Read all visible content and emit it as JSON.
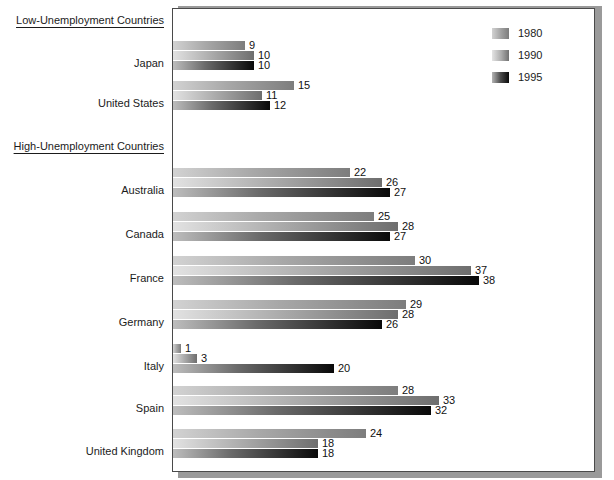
{
  "figure": {
    "background_color": "#ffffff",
    "frame_border_color": "#4a4a4a",
    "shadow_color": "#9a9a9a"
  },
  "groups": [
    {
      "heading": "Low-Unemployment Countries"
    },
    {
      "heading": "High-Unemployment Countries"
    }
  ],
  "legend": {
    "position": "top-right",
    "entries": [
      {
        "label": "1980",
        "swatch": "gradient-light-gray"
      },
      {
        "label": "1990",
        "swatch": "gradient-mid-gray"
      },
      {
        "label": "1995",
        "swatch": "gradient-black"
      }
    ]
  },
  "chart_data": {
    "type": "bar",
    "orientation": "horizontal",
    "title": "",
    "subtitle": "",
    "xlabel": "",
    "ylabel": "",
    "xlim": [
      0,
      38
    ],
    "grid": false,
    "legend_position": "top-right",
    "group_labels": [
      "Low-Unemployment Countries",
      "High-Unemployment Countries"
    ],
    "categories": [
      "Japan",
      "United States",
      "Australia",
      "Canada",
      "France",
      "Germany",
      "Italy",
      "Spain",
      "United Kingdom"
    ],
    "category_groups": [
      "Low-Unemployment Countries",
      "Low-Unemployment Countries",
      "High-Unemployment Countries",
      "High-Unemployment Countries",
      "High-Unemployment Countries",
      "High-Unemployment Countries",
      "High-Unemployment Countries",
      "High-Unemployment Countries",
      "High-Unemployment Countries"
    ],
    "series": [
      {
        "name": "1980",
        "values": [
          9,
          15,
          22,
          25,
          30,
          29,
          1,
          28,
          24
        ]
      },
      {
        "name": "1990",
        "values": [
          10,
          11,
          26,
          28,
          37,
          28,
          3,
          33,
          18
        ]
      },
      {
        "name": "1995",
        "values": [
          10,
          12,
          27,
          27,
          38,
          26,
          20,
          32,
          18
        ]
      }
    ]
  },
  "rows": [
    {
      "label": "Japan",
      "group": "low",
      "bars": [
        {
          "series": "1980",
          "value": 9,
          "value_text": "9"
        },
        {
          "series": "1990",
          "value": 10,
          "value_text": "10"
        },
        {
          "series": "1995",
          "value": 10,
          "value_text": "10"
        }
      ]
    },
    {
      "label": "United States",
      "group": "low",
      "bars": [
        {
          "series": "1980",
          "value": 15,
          "value_text": "15"
        },
        {
          "series": "1990",
          "value": 11,
          "value_text": "11"
        },
        {
          "series": "1995",
          "value": 12,
          "value_text": "12"
        }
      ]
    },
    {
      "label": "Australia",
      "group": "high",
      "bars": [
        {
          "series": "1980",
          "value": 22,
          "value_text": "22"
        },
        {
          "series": "1990",
          "value": 26,
          "value_text": "26"
        },
        {
          "series": "1995",
          "value": 27,
          "value_text": "27"
        }
      ]
    },
    {
      "label": "Canada",
      "group": "high",
      "bars": [
        {
          "series": "1980",
          "value": 25,
          "value_text": "25"
        },
        {
          "series": "1990",
          "value": 28,
          "value_text": "28"
        },
        {
          "series": "1995",
          "value": 27,
          "value_text": "27"
        }
      ]
    },
    {
      "label": "France",
      "group": "high",
      "bars": [
        {
          "series": "1980",
          "value": 30,
          "value_text": "30"
        },
        {
          "series": "1990",
          "value": 37,
          "value_text": "37"
        },
        {
          "series": "1995",
          "value": 38,
          "value_text": "38"
        }
      ]
    },
    {
      "label": "Germany",
      "group": "high",
      "bars": [
        {
          "series": "1980",
          "value": 29,
          "value_text": "29"
        },
        {
          "series": "1990",
          "value": 28,
          "value_text": "28"
        },
        {
          "series": "1995",
          "value": 26,
          "value_text": "26"
        }
      ]
    },
    {
      "label": "Italy",
      "group": "high",
      "bars": [
        {
          "series": "1980",
          "value": 1,
          "value_text": "1"
        },
        {
          "series": "1990",
          "value": 3,
          "value_text": "3"
        },
        {
          "series": "1995",
          "value": 20,
          "value_text": "20"
        }
      ]
    },
    {
      "label": "Spain",
      "group": "high",
      "bars": [
        {
          "series": "1980",
          "value": 28,
          "value_text": "28"
        },
        {
          "series": "1990",
          "value": 33,
          "value_text": "33"
        },
        {
          "series": "1995",
          "value": 32,
          "value_text": "32"
        }
      ]
    },
    {
      "label": "United Kingdom",
      "group": "high",
      "bars": [
        {
          "series": "1980",
          "value": 24,
          "value_text": "24"
        },
        {
          "series": "1990",
          "value": 18,
          "value_text": "18"
        },
        {
          "series": "1995",
          "value": 18,
          "value_text": "18"
        }
      ]
    }
  ],
  "layout": {
    "plot_left_px": 172,
    "plot_top_px": 8,
    "plot_width_px": 423,
    "plot_height_px": 464,
    "px_per_unit": 8.05,
    "bar_height_px": 9,
    "group_top_offsets": {
      "Japan": 40,
      "United States": 80,
      "Australia": 167,
      "Canada": 211,
      "France": 255,
      "Germany": 299,
      "Italy": 343,
      "Spain": 385,
      "United Kingdom": 428
    },
    "heading_tops": {
      "low": 14,
      "high": 140
    },
    "label_tops": {
      "Japan": 58,
      "United States": 98,
      "Australia": 185,
      "Canada": 229,
      "France": 273,
      "Germany": 317,
      "Italy": 361,
      "Spain": 403,
      "United Kingdom": 446
    }
  }
}
